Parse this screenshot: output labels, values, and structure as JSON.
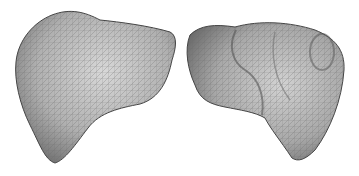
{
  "figure": {
    "background": "#ffffff",
    "panels": [
      {
        "label": "liver-mesh-anterior-view",
        "fill": "#bdbdbd",
        "edge": "#555555"
      },
      {
        "label": "liver-mesh-posterior-view",
        "fill": "#b8b8b8",
        "edge": "#555555"
      }
    ]
  }
}
